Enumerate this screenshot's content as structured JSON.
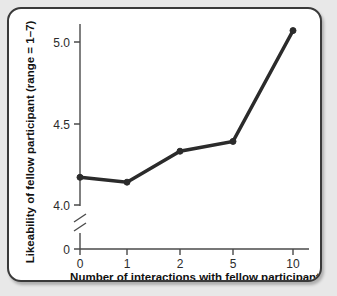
{
  "chart_data": {
    "type": "line",
    "title": "",
    "subtitle": "",
    "xlabel": "Number of interactions with fellow participant",
    "ylabel": "Likeability of fellow participant (range = 1–7)",
    "categories": [
      "0",
      "1",
      "2",
      "5",
      "10"
    ],
    "x": [
      0,
      1,
      2,
      5,
      10
    ],
    "values": [
      4.17,
      4.14,
      4.33,
      4.39,
      5.07
    ],
    "series": [
      {
        "name": "Likeability",
        "values": [
          4.17,
          4.14,
          4.33,
          4.39,
          5.07
        ]
      }
    ],
    "ytick_labels": [
      "5.0",
      "4.5",
      "4.0",
      "0"
    ],
    "ytick_values": [
      5.0,
      4.5,
      4.0,
      0
    ],
    "xtick_labels": [
      "0",
      "1",
      "2",
      "5",
      "10"
    ],
    "ylim": [
      4.0,
      5.2
    ],
    "axis_break": true,
    "axis_break_note": "y-axis broken between 0 and 4.0",
    "grid": false,
    "legend": false,
    "legend_position": "none",
    "line_color": "#2b2b2b",
    "marker": "circle",
    "axis_color": "#4a4a4a"
  },
  "figure": {
    "background_color": "#ffffff",
    "page_background_color": "#e8e8e8",
    "border_color": "#3a3a3a"
  }
}
